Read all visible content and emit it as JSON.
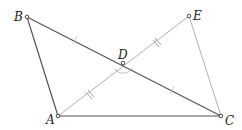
{
  "diagram": {
    "type": "geometry",
    "points": {
      "A": {
        "label": "A",
        "x": 58,
        "y": 116
      },
      "B": {
        "label": "B",
        "x": 27,
        "y": 17
      },
      "C": {
        "label": "C",
        "x": 221,
        "y": 116
      },
      "D": {
        "label": "D",
        "x": 123,
        "y": 63
      },
      "E": {
        "label": "E",
        "x": 189,
        "y": 16
      }
    },
    "segments": [
      {
        "from": "A",
        "to": "B",
        "style": "dark"
      },
      {
        "from": "A",
        "to": "C",
        "style": "dark"
      },
      {
        "from": "B",
        "to": "C",
        "style": "dark"
      },
      {
        "from": "A",
        "to": "E",
        "style": "light"
      },
      {
        "from": "E",
        "to": "C",
        "style": "light"
      }
    ],
    "tick_marks": [
      {
        "segment": "BD",
        "count": 1
      },
      {
        "segment": "DC",
        "count": 1
      },
      {
        "segment": "AD",
        "count": 2
      },
      {
        "segment": "DE",
        "count": 2
      }
    ],
    "angle_marks": [
      {
        "vertex": "D",
        "between": [
          "A",
          "C"
        ]
      }
    ],
    "colors": {
      "dark": "#555555",
      "light": "#aaaaaa",
      "label": "#222222"
    }
  }
}
